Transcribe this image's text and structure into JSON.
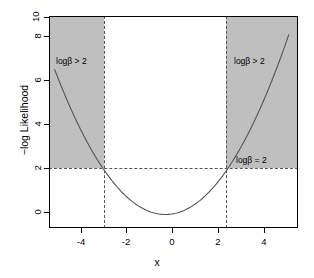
{
  "chart_data": {
    "type": "line",
    "title": "",
    "xlabel": "x",
    "ylabel": "-log Likelihood",
    "xlim": [
      -5.4,
      5.4
    ],
    "ylim": [
      -1.64,
      10.0
    ],
    "xticks": [
      -4,
      -2,
      0,
      2,
      4
    ],
    "xtick_labels": [
      "-4",
      "-2",
      "0",
      "2",
      "4"
    ],
    "yticks": [
      0,
      2,
      4,
      6,
      8,
      10
    ],
    "ytick_labels": [
      "0",
      "2",
      "4",
      "6",
      "8",
      "10"
    ],
    "grid": false,
    "legend": "none",
    "series": [
      {
        "name": "profile -log likelihood",
        "type": "parabola",
        "vertex_x": -0.35,
        "vertex_y": -0.9,
        "curvature": 0.345,
        "x_start": -5.15,
        "x_end": 5.0,
        "color": "#555555",
        "x": [
          -5.15,
          -4.75,
          -4.25,
          -3.75,
          -3.25,
          -2.75,
          -2.25,
          -1.75,
          -1.25,
          -0.75,
          -0.35,
          0.0,
          0.5,
          1.0,
          1.5,
          2.0,
          2.5,
          3.0,
          3.5,
          4.0,
          4.5,
          5.0
        ],
        "y": [
          7.32,
          6.07,
          4.61,
          3.33,
          2.23,
          1.31,
          0.57,
          0.01,
          -0.37,
          -0.84,
          -0.9,
          -0.86,
          -0.64,
          -0.24,
          0.33,
          1.07,
          1.99,
          3.08,
          4.34,
          5.78,
          7.39,
          9.17
        ]
      }
    ],
    "reference_lines": {
      "horizontal": [
        {
          "y": 2.0,
          "style": "dashed",
          "color": "#555555"
        }
      ],
      "vertical": [
        {
          "x": -3.0,
          "style": "dashed",
          "color": "#555555"
        },
        {
          "x": 2.4,
          "style": "dashed",
          "color": "#555555"
        }
      ]
    },
    "shaded_regions": [
      {
        "x_from": -5.4,
        "x_to": -3.0,
        "y_from": 2.0,
        "y_to": 10.0,
        "color": "#bfbfbf"
      },
      {
        "x_from": 2.4,
        "x_to": 5.4,
        "y_from": 2.0,
        "y_to": 10.0,
        "color": "#bfbfbf"
      }
    ],
    "annotations": [
      {
        "id": "left-region-label",
        "text": "logβ > 2",
        "x": -4.7,
        "y": 8.0
      },
      {
        "id": "right-region-label",
        "text": "logβ > 2",
        "x": 2.75,
        "y": 8.0
      },
      {
        "id": "threshold-label",
        "text": "logβ = 2",
        "x": 2.85,
        "y": 2.55
      }
    ]
  },
  "axes": {
    "x_label": "x",
    "y_label": "−log Likelihood",
    "x_ticks": [
      "-4",
      "-2",
      "0",
      "2",
      "4"
    ],
    "y_ticks": [
      "0",
      "2",
      "4",
      "6",
      "8",
      "10"
    ]
  },
  "annotations": {
    "left_region": "logβ > 2",
    "right_region": "logβ > 2",
    "threshold": "logβ = 2"
  },
  "colors": {
    "shade": "#bfbfbf",
    "curve": "#555555",
    "dashed": "#555555",
    "axis": "#000000",
    "background": "#ffffff"
  }
}
